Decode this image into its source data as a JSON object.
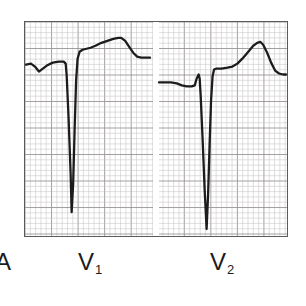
{
  "figure": {
    "kind": "ecg-strip",
    "panel_letter": "A",
    "paper": {
      "background_color": "#ffffff",
      "minor_grid_color": "#c2bdbd",
      "major_grid_color": "#9a9494",
      "border_color": "#5a5a5a",
      "minor_grid_mm": 5.35,
      "major_every": 5
    },
    "trace": {
      "color": "#1c1c1c",
      "width_px": 2.3
    }
  },
  "labels": {
    "panel_a": "A",
    "v1_letter": "V",
    "v1_subscript": "1",
    "v2_letter": "V",
    "v2_subscript": "2"
  },
  "chart_data": {
    "type": "line",
    "title": "",
    "xlabel": "",
    "ylabel": "",
    "grid": true,
    "legend_position": "below",
    "axis_note": "ECG graph paper: small square = 0.04 s horizontally, 0.1 mV vertically",
    "series": [
      {
        "name": "V1",
        "lead": "V1",
        "morphology": "rS complex with deep S wave and upright T wave",
        "baseline_y": 64,
        "points": [
          [
            25,
            64
          ],
          [
            30,
            63
          ],
          [
            34,
            66
          ],
          [
            38,
            71
          ],
          [
            42,
            68
          ],
          [
            46,
            65
          ],
          [
            52,
            62
          ],
          [
            58,
            61
          ],
          [
            63,
            61
          ],
          [
            65,
            63
          ],
          [
            66,
            75
          ],
          [
            68,
            120
          ],
          [
            70,
            175
          ],
          [
            71,
            213
          ],
          [
            72.5,
            185
          ],
          [
            74,
            130
          ],
          [
            75.5,
            80
          ],
          [
            77,
            58
          ],
          [
            79,
            51
          ],
          [
            82,
            49
          ],
          [
            86,
            48
          ],
          [
            90,
            47
          ],
          [
            95,
            45
          ],
          [
            101,
            42
          ],
          [
            107,
            40
          ],
          [
            113,
            38
          ],
          [
            118,
            37
          ],
          [
            121,
            37
          ],
          [
            125,
            40
          ],
          [
            129,
            46
          ],
          [
            133,
            52
          ],
          [
            137,
            56
          ],
          [
            141,
            57
          ],
          [
            146,
            57
          ],
          [
            150,
            57
          ]
        ]
      },
      {
        "name": "V2",
        "lead": "V2",
        "morphology": "rS complex with very deep S wave and tall upright T wave",
        "baseline_y": 82,
        "points": [
          [
            159,
            82
          ],
          [
            165,
            82
          ],
          [
            171,
            82
          ],
          [
            177,
            83
          ],
          [
            182,
            85
          ],
          [
            187,
            86
          ],
          [
            192,
            86
          ],
          [
            195,
            85
          ],
          [
            197,
            78
          ],
          [
            199,
            74
          ],
          [
            200,
            78
          ],
          [
            201,
            95
          ],
          [
            203,
            140
          ],
          [
            205,
            190
          ],
          [
            207,
            230
          ],
          [
            208.5,
            195
          ],
          [
            210,
            145
          ],
          [
            211.5,
            100
          ],
          [
            213,
            76
          ],
          [
            214.5,
            69
          ],
          [
            217,
            68
          ],
          [
            222,
            68
          ],
          [
            228,
            67
          ],
          [
            233,
            66
          ],
          [
            238,
            63
          ],
          [
            243,
            58
          ],
          [
            249,
            51
          ],
          [
            254,
            45
          ],
          [
            258,
            42
          ],
          [
            261,
            41
          ],
          [
            264,
            44
          ],
          [
            268,
            52
          ],
          [
            272,
            62
          ],
          [
            276,
            70
          ],
          [
            280,
            73
          ],
          [
            284,
            74
          ],
          [
            287,
            74
          ]
        ]
      }
    ],
    "strip_gap": {
      "x_start": 152,
      "x_end": 158
    },
    "measurements": {
      "v1_s_wave_nadir_y": 213,
      "v1_t_peak_y": 37,
      "v2_s_wave_nadir_y": 230,
      "v2_t_peak_y": 41
    }
  }
}
